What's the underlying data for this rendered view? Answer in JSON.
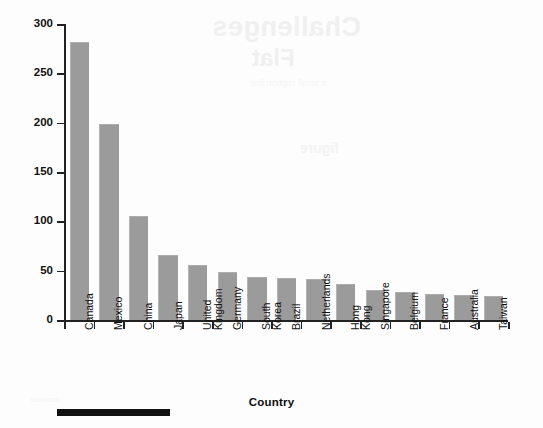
{
  "chart_data": {
    "type": "bar",
    "title": "",
    "xlabel": "Country",
    "ylabel": "Exports (Billions of Dollars)",
    "categories": [
      "Canada",
      "Mexico",
      "China",
      "Japan",
      "United Kingdom",
      "Germany",
      "South Korea",
      "Brazil",
      "Netherlands",
      "Hong Kong",
      "Singapore",
      "Belgium",
      "France",
      "Australia",
      "Taiwan"
    ],
    "values": [
      281,
      198,
      104,
      65,
      55,
      48,
      43,
      42,
      41,
      35,
      29,
      27,
      25,
      24,
      23
    ],
    "ylim": [
      0,
      300
    ],
    "yticks": [
      0,
      50,
      100,
      150,
      200,
      250,
      300
    ],
    "ytick_labels": [
      "0",
      "50",
      "100",
      "150",
      "200",
      "250",
      "300"
    ],
    "grid": false,
    "legend": "none",
    "bar_color": "#9b9b9b",
    "axis_color": "#222222"
  },
  "axis": {
    "y_title": "Exports (Billions of Dollars)",
    "x_title": "Country"
  },
  "background_bleed": {
    "line1": "Challenges",
    "line2": "Flat",
    "line3": "a small caption line",
    "line4": "figure",
    "line5": "footnote"
  }
}
